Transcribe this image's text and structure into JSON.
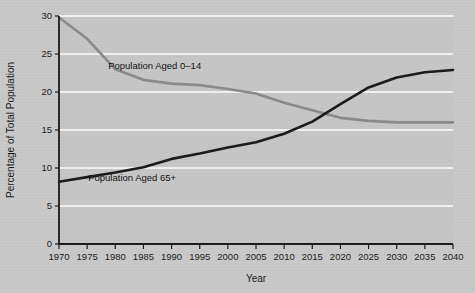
{
  "chart_data": {
    "type": "line",
    "title": "",
    "xlabel": "Year",
    "ylabel": "Percentage of Total Population",
    "xlim": [
      1970,
      2040
    ],
    "ylim": [
      0,
      30
    ],
    "grid": true,
    "legend_position": "inline-annotations",
    "background_color": "#c9c9c9",
    "gridline_color": "#ffffff",
    "axis_color": "#1a1a1a",
    "x": [
      1970,
      1975,
      1980,
      1985,
      1990,
      1995,
      2000,
      2005,
      2010,
      2015,
      2020,
      2025,
      2030,
      2035,
      2040
    ],
    "xticklabels": [
      "1970",
      "1975",
      "1980",
      "1985",
      "1990",
      "1995",
      "2000",
      "2005",
      "2010",
      "2015",
      "2020",
      "2025",
      "2030",
      "2035",
      "2040"
    ],
    "yticks": [
      0,
      5,
      10,
      15,
      20,
      25,
      30
    ],
    "yticklabels": [
      "0",
      "5",
      "10",
      "15",
      "20",
      "25",
      "30"
    ],
    "series": [
      {
        "name": "Population Aged 0–14",
        "color": "#8a8a8a",
        "width": 2.6,
        "label": "Population Aged 0–14",
        "label_x": 1987,
        "label_y": 23.0,
        "values": [
          29.8,
          27.0,
          23.0,
          21.6,
          21.1,
          20.9,
          20.4,
          19.8,
          18.6,
          17.6,
          16.6,
          16.2,
          16.0,
          16.0,
          16.0
        ]
      },
      {
        "name": "Population Aged 65+",
        "color": "#1a1a1a",
        "width": 2.6,
        "label": "Population Aged 65+",
        "label_x": 1983,
        "label_y": 8.3,
        "values": [
          8.2,
          8.8,
          9.4,
          10.1,
          11.2,
          11.9,
          12.7,
          13.4,
          14.5,
          16.1,
          18.4,
          20.6,
          21.9,
          22.6,
          22.9
        ]
      }
    ],
    "crossing": {
      "year": 2018,
      "value": 16.9
    }
  }
}
